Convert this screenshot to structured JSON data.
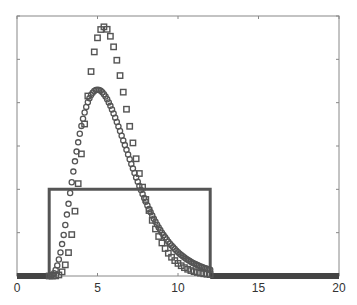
{
  "chart_data": {
    "type": "line",
    "title": "",
    "xlabel": "",
    "ylabel": "",
    "xlim": [
      0,
      20
    ],
    "ylim": [
      0,
      6
    ],
    "grid": false,
    "legend": null,
    "x_ticks": [
      0,
      5,
      10,
      15,
      20
    ],
    "x_tick_labels": [
      "0",
      "5",
      "10",
      "15",
      "20"
    ],
    "y_ticks": [
      0,
      1,
      2,
      3,
      4,
      5,
      6
    ],
    "y_tick_labels": [],
    "series": [
      {
        "name": "rectangular pulse",
        "style": "solid-line",
        "color": "#555555",
        "x": [
          0,
          2,
          2,
          12,
          12,
          20
        ],
        "y": [
          0,
          0,
          2,
          2,
          0,
          0
        ]
      },
      {
        "name": "circle markers",
        "style": "circle-markers",
        "color": "#555555",
        "peak_x": 5.0,
        "peak_y": 4.3,
        "start_x": 2.0,
        "shape_k": 3,
        "x_range": [
          2,
          12
        ],
        "step": 0.1
      },
      {
        "name": "square markers",
        "style": "square-markers",
        "color": "#555555",
        "peak_x": 5.4,
        "peak_y": 5.75,
        "start_x": 2.0,
        "shape_k": 6,
        "x_range": [
          2,
          12
        ],
        "step": 0.2
      }
    ]
  },
  "plot_box": {
    "left": 17,
    "top": 16,
    "right": 339,
    "bottom": 276
  }
}
